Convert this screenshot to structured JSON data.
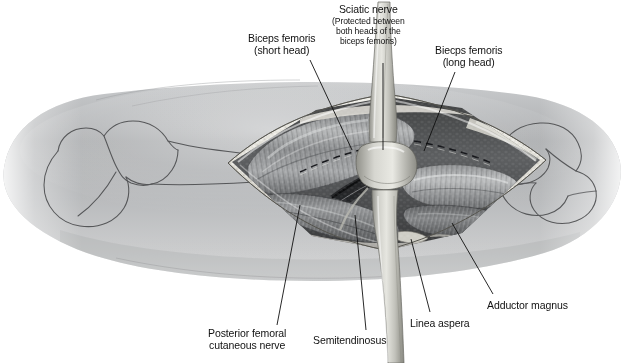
{
  "figure": {
    "orientation": "Right thigh, posterior approach, knee to the right",
    "style": "grayscale medical illustration",
    "background_color": "#ffffff",
    "skin_color": "#b9bbbd",
    "muscle_color": "#8e9092",
    "fat_color": "#dcdcd8",
    "nerve_color": "#cfcfca",
    "line_color": "#1a1a1a"
  },
  "labels": [
    {
      "id": "biceps-femoris-short-head",
      "line1": "Biceps femoris",
      "line2": "(short head)",
      "sub": [],
      "x": 248,
      "y": 33,
      "leader": [
        [
          310,
          60
        ],
        [
          352,
          150
        ]
      ]
    },
    {
      "id": "sciatic-nerve",
      "line1": "Sciatic nerve",
      "line2": "",
      "sub": [
        "(Protected between",
        "both heads of the",
        "biceps femoris)"
      ],
      "x": 332,
      "y": 4,
      "leader": [
        [
          383,
          63
        ],
        [
          383,
          150
        ]
      ]
    },
    {
      "id": "biceps-femoris-long-head",
      "line1": "Biecps femoris",
      "line2": "(long head)",
      "sub": [],
      "x": 435,
      "y": 45,
      "leader": [
        [
          455,
          72
        ],
        [
          424,
          151
        ]
      ]
    },
    {
      "id": "posterior-femoral-cutaneous-nerve",
      "line1": "Posterior femoral",
      "line2": "cutaneous nerve",
      "sub": [],
      "x": 208,
      "y": 328,
      "leader": [
        [
          277,
          325
        ],
        [
          300,
          205
        ]
      ]
    },
    {
      "id": "semitendinosus",
      "line1": "Semitendinosus",
      "line2": "",
      "sub": [],
      "x": 313,
      "y": 335,
      "leader": [
        [
          366,
          330
        ],
        [
          355,
          215
        ]
      ]
    },
    {
      "id": "linea-aspera",
      "line1": "Linea aspera",
      "line2": "",
      "sub": [],
      "x": 410,
      "y": 318,
      "leader": [
        [
          430,
          312
        ],
        [
          411,
          239
        ]
      ]
    },
    {
      "id": "adductor-magnus",
      "line1": "Adductor magnus",
      "line2": "",
      "sub": [],
      "x": 487,
      "y": 300,
      "leader": [
        [
          493,
          294
        ],
        [
          452,
          223
        ]
      ]
    }
  ]
}
